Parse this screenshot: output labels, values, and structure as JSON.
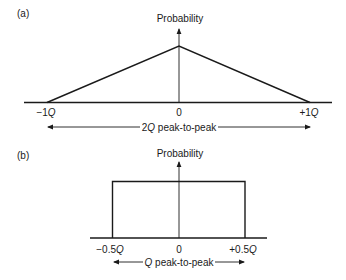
{
  "panels": [
    {
      "id": "a",
      "label": "(a)",
      "y_axis_label": "Probability",
      "shape": "triangle",
      "x_ticks": [
        {
          "value": "−1",
          "unit": "Q"
        },
        {
          "value": "0",
          "unit": ""
        },
        {
          "value": "+1",
          "unit": "Q"
        }
      ],
      "span_label": {
        "prefix": "2",
        "unit": "Q",
        "suffix": " peak-to-peak"
      }
    },
    {
      "id": "b",
      "label": "(b)",
      "y_axis_label": "Probability",
      "shape": "rectangle",
      "x_ticks": [
        {
          "value": "−0.5",
          "unit": "Q"
        },
        {
          "value": "0",
          "unit": ""
        },
        {
          "value": "+0.5",
          "unit": "Q"
        }
      ],
      "span_label": {
        "prefix": "",
        "unit": "Q",
        "suffix": " peak-to-peak"
      }
    }
  ],
  "colors": {
    "ink": "#1a1a1a",
    "background": "#ffffff"
  }
}
